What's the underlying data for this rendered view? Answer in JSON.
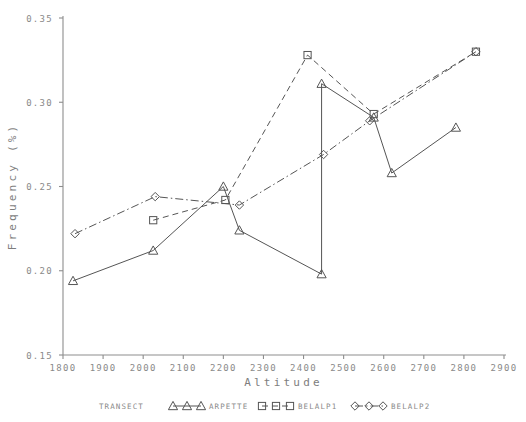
{
  "chart_data": {
    "type": "line",
    "title": "",
    "xlabel": "Altitude",
    "ylabel": "Frequency (%)",
    "xlim": [
      1800,
      2900
    ],
    "ylim": [
      0.15,
      0.35
    ],
    "xticks": [
      1800,
      1900,
      2000,
      2100,
      2200,
      2300,
      2400,
      2500,
      2600,
      2700,
      2800,
      2900
    ],
    "yticks": [
      0.15,
      0.2,
      0.25,
      0.3,
      0.35
    ],
    "xtick_labels": [
      "1800",
      "1900",
      "2000",
      "2100",
      "2200",
      "2300",
      "2400",
      "2500",
      "2600",
      "2700",
      "2800",
      "2900"
    ],
    "ytick_labels": [
      "0.15",
      "0.20",
      "0.25",
      "0.30",
      "0.35"
    ],
    "grid": false,
    "legend_position": "bottom",
    "legend_title": "TRANSECT",
    "series": [
      {
        "name": "ARPETTE",
        "marker": "triangle",
        "linestyle": "solid",
        "color": "#555555",
        "points": [
          {
            "x": 1825,
            "y": 0.194
          },
          {
            "x": 2025,
            "y": 0.212
          },
          {
            "x": 2200,
            "y": 0.25
          },
          {
            "x": 2240,
            "y": 0.224
          },
          {
            "x": 2445,
            "y": 0.198
          },
          {
            "x": 2445,
            "y": 0.311
          },
          {
            "x": 2575,
            "y": 0.291
          },
          {
            "x": 2620,
            "y": 0.258
          },
          {
            "x": 2780,
            "y": 0.285
          }
        ]
      },
      {
        "name": "BELALP1",
        "marker": "square",
        "linestyle": "dashed",
        "color": "#555555",
        "points": [
          {
            "x": 2025,
            "y": 0.23
          },
          {
            "x": 2205,
            "y": 0.242
          },
          {
            "x": 2410,
            "y": 0.328
          },
          {
            "x": 2575,
            "y": 0.293
          },
          {
            "x": 2830,
            "y": 0.33
          }
        ]
      },
      {
        "name": "BELALP2",
        "marker": "diamond",
        "linestyle": "dashdot",
        "color": "#555555",
        "points": [
          {
            "x": 1830,
            "y": 0.222
          },
          {
            "x": 2030,
            "y": 0.244
          },
          {
            "x": 2240,
            "y": 0.239
          },
          {
            "x": 2450,
            "y": 0.269
          },
          {
            "x": 2565,
            "y": 0.289
          },
          {
            "x": 2830,
            "y": 0.33
          }
        ]
      }
    ]
  },
  "legend": {
    "label": "TRANSECT",
    "entries": [
      {
        "name": "ARPETTE",
        "marker": "triangle",
        "linestyle": "solid"
      },
      {
        "name": "BELALP1",
        "marker": "square",
        "linestyle": "dashed"
      },
      {
        "name": "BELALP2",
        "marker": "diamond",
        "linestyle": "dashdot"
      }
    ]
  }
}
